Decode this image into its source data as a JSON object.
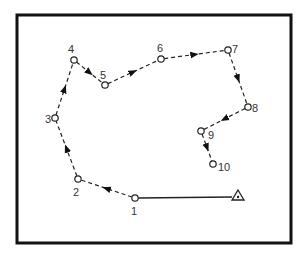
{
  "diagram": {
    "frame": {
      "x": 17,
      "y": 15,
      "w": 274,
      "h": 228,
      "stroke": "#111111"
    },
    "points": [
      {
        "label": "1",
        "x": 135,
        "y": 198,
        "lx": 131,
        "ly": 215
      },
      {
        "label": "2",
        "x": 78,
        "y": 179,
        "lx": 73,
        "ly": 196
      },
      {
        "label": "3",
        "x": 55,
        "y": 118,
        "lx": 45,
        "ly": 123
      },
      {
        "label": "4",
        "x": 74,
        "y": 60,
        "lx": 68,
        "ly": 53
      },
      {
        "label": "5",
        "x": 105,
        "y": 85,
        "lx": 100,
        "ly": 79
      },
      {
        "label": "6",
        "x": 161,
        "y": 59,
        "lx": 157,
        "ly": 52
      },
      {
        "label": "7",
        "x": 228,
        "y": 50,
        "lx": 232,
        "ly": 53
      },
      {
        "label": "8",
        "x": 248,
        "y": 107,
        "lx": 252,
        "ly": 112
      },
      {
        "label": "9",
        "x": 201,
        "y": 131,
        "lx": 208,
        "ly": 139
      },
      {
        "label": "10",
        "x": 213,
        "y": 164,
        "lx": 218,
        "ly": 171
      }
    ],
    "station": {
      "symbol": "triangle",
      "x": 238,
      "y": 197
    },
    "solid_line": {
      "from": "1",
      "to": "station"
    },
    "dashed_path_order": [
      "1",
      "2",
      "3",
      "4",
      "5",
      "6",
      "7",
      "8",
      "9",
      "10"
    ]
  }
}
